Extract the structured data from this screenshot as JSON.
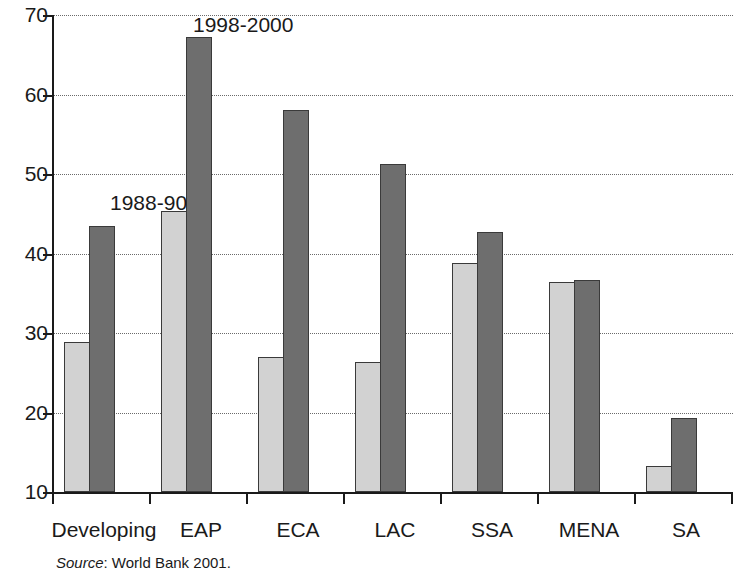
{
  "chart_data": {
    "type": "bar",
    "title": "",
    "xlabel": "",
    "ylabel": "",
    "ylim": [
      10,
      70
    ],
    "yticks": [
      10,
      20,
      30,
      40,
      50,
      60,
      70
    ],
    "grid": true,
    "legend_position": "inline-annotations",
    "categories": [
      "Developing",
      "EAP",
      "ECA",
      "LAC",
      "SSA",
      "MENA",
      "SA"
    ],
    "series": [
      {
        "name": "1988-90",
        "color": "#d2d2d2",
        "values": [
          28.9,
          45.3,
          27.0,
          26.4,
          38.8,
          36.4,
          13.3
        ]
      },
      {
        "name": "1998-2000",
        "color": "#6e6e6e",
        "values": [
          43.5,
          67.2,
          58.1,
          51.3,
          42.7,
          36.7,
          19.3
        ]
      }
    ],
    "annotations": [
      {
        "text": "1988-90",
        "series": "1988-90"
      },
      {
        "text": "1998-2000",
        "series": "1998-2000"
      }
    ],
    "source": {
      "prefix": "Source",
      "text": ": World Bank 2001."
    }
  },
  "axis": {
    "y_tick_labels": [
      "70",
      "60",
      "50",
      "40",
      "30",
      "20",
      "10"
    ]
  }
}
